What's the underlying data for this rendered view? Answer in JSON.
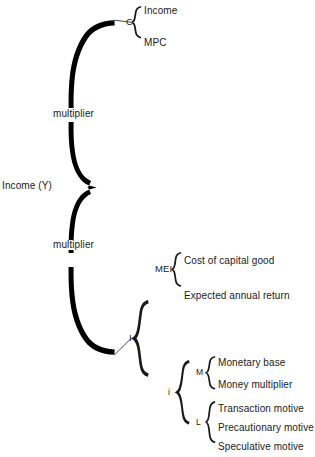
{
  "diagram": {
    "type": "brace-tree",
    "root": {
      "label": "Income (Y)"
    },
    "branch_labels": {
      "multiplier_upper": "multiplier",
      "multiplier_lower": "multiplier"
    },
    "nodes": {
      "consumption_key": "C",
      "investment_key": "I",
      "mei_key": "MEI",
      "interest_key": "i",
      "money_supply_key": "M",
      "money_demand_key": "L"
    },
    "leaves": {
      "consumption": [
        "Income",
        "MPC"
      ],
      "mei": [
        "Cost of capital good",
        "Expected annual return"
      ],
      "money_supply": [
        "Monetary base",
        "Money multiplier"
      ],
      "money_demand": [
        "Transaction motive",
        "Precautionary motive",
        "Speculative motive"
      ]
    },
    "colors": {
      "ink": "#1a1a1a",
      "brace_fill": "#000000",
      "background": "#ffffff"
    }
  }
}
